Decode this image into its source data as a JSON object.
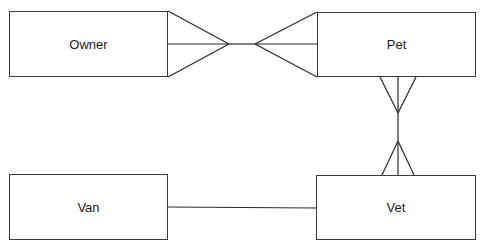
{
  "diagram": {
    "type": "entity-relationship",
    "notation": "crow's foot",
    "line_color": "#2a2a2a",
    "entities": [
      {
        "id": "owner",
        "label": "Owner",
        "x": 9,
        "y": 11,
        "w": 159,
        "h": 66
      },
      {
        "id": "pet",
        "label": "Pet",
        "x": 317,
        "y": 12,
        "w": 159,
        "h": 65
      },
      {
        "id": "van",
        "label": "Van",
        "x": 9,
        "y": 174,
        "w": 159,
        "h": 66
      },
      {
        "id": "vet",
        "label": "Vet",
        "x": 316,
        "y": 175,
        "w": 160,
        "h": 65
      }
    ],
    "relationships": [
      {
        "from": "owner",
        "to": "pet",
        "from_cardinality": "many",
        "to_cardinality": "many"
      },
      {
        "from": "pet",
        "to": "vet",
        "from_cardinality": "many",
        "to_cardinality": "many"
      },
      {
        "from": "van",
        "to": "vet",
        "from_cardinality": "one",
        "to_cardinality": "one"
      }
    ]
  }
}
